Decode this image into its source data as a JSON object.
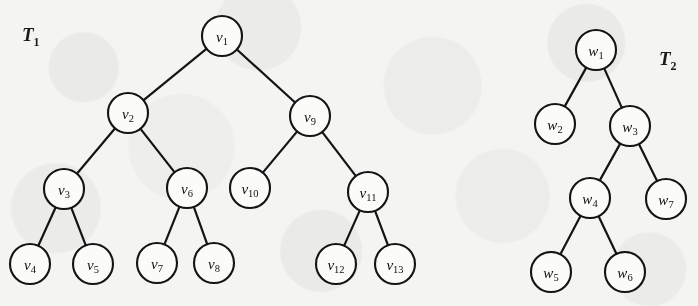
{
  "figure": {
    "type": "diagram",
    "background_color": "#f4f4f3",
    "ink_color": "#141414",
    "node_fill_color": "#fbfbfa",
    "node_radius": 20
  },
  "trees": [
    {
      "id": "T1",
      "label_main": "T",
      "label_sub": "1",
      "label_x": 22,
      "label_y": 24,
      "nodes": [
        {
          "id": "v1",
          "main": "v",
          "sub": "1",
          "x": 222,
          "y": 36
        },
        {
          "id": "v2",
          "main": "v",
          "sub": "2",
          "x": 128,
          "y": 113
        },
        {
          "id": "v3",
          "main": "v",
          "sub": "3",
          "x": 64,
          "y": 189
        },
        {
          "id": "v4",
          "main": "v",
          "sub": "4",
          "x": 30,
          "y": 264
        },
        {
          "id": "v5",
          "main": "v",
          "sub": "5",
          "x": 93,
          "y": 264
        },
        {
          "id": "v6",
          "main": "v",
          "sub": "6",
          "x": 187,
          "y": 188
        },
        {
          "id": "v7",
          "main": "v",
          "sub": "7",
          "x": 157,
          "y": 263
        },
        {
          "id": "v8",
          "main": "v",
          "sub": "8",
          "x": 214,
          "y": 263
        },
        {
          "id": "v9",
          "main": "v",
          "sub": "9",
          "x": 310,
          "y": 116
        },
        {
          "id": "v10",
          "main": "v",
          "sub": "10",
          "x": 250,
          "y": 188
        },
        {
          "id": "v11",
          "main": "v",
          "sub": "11",
          "x": 368,
          "y": 192
        },
        {
          "id": "v12",
          "main": "v",
          "sub": "12",
          "x": 336,
          "y": 264
        },
        {
          "id": "v13",
          "main": "v",
          "sub": "13",
          "x": 395,
          "y": 264
        }
      ],
      "edges": [
        [
          "v1",
          "v2"
        ],
        [
          "v1",
          "v9"
        ],
        [
          "v2",
          "v3"
        ],
        [
          "v2",
          "v6"
        ],
        [
          "v3",
          "v4"
        ],
        [
          "v3",
          "v5"
        ],
        [
          "v6",
          "v7"
        ],
        [
          "v6",
          "v8"
        ],
        [
          "v9",
          "v10"
        ],
        [
          "v9",
          "v11"
        ],
        [
          "v11",
          "v12"
        ],
        [
          "v11",
          "v13"
        ]
      ]
    },
    {
      "id": "T2",
      "label_main": "T",
      "label_sub": "2",
      "label_x": 659,
      "label_y": 48,
      "nodes": [
        {
          "id": "w1",
          "main": "w",
          "sub": "1",
          "x": 596,
          "y": 50
        },
        {
          "id": "w2",
          "main": "w",
          "sub": "2",
          "x": 555,
          "y": 124
        },
        {
          "id": "w3",
          "main": "w",
          "sub": "3",
          "x": 630,
          "y": 126
        },
        {
          "id": "w4",
          "main": "w",
          "sub": "4",
          "x": 590,
          "y": 198
        },
        {
          "id": "w5",
          "main": "w",
          "sub": "5",
          "x": 551,
          "y": 272
        },
        {
          "id": "w6",
          "main": "w",
          "sub": "6",
          "x": 625,
          "y": 272
        },
        {
          "id": "w7",
          "main": "w",
          "sub": "7",
          "x": 666,
          "y": 199
        }
      ],
      "edges": [
        [
          "w1",
          "w2"
        ],
        [
          "w1",
          "w3"
        ],
        [
          "w3",
          "w4"
        ],
        [
          "w3",
          "w7"
        ],
        [
          "w4",
          "w5"
        ],
        [
          "w4",
          "w6"
        ]
      ]
    }
  ]
}
